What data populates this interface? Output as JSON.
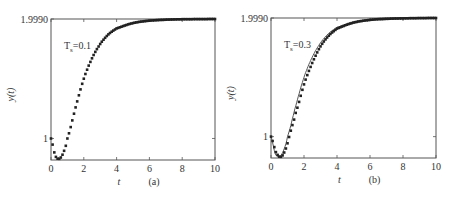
{
  "chart_data": [
    {
      "type": "line",
      "panel_label": "(a)",
      "annotation": {
        "text": "T",
        "subscript": "s",
        "value": "=0.1"
      },
      "xlabel": "t",
      "ylabel": "y(t)",
      "xlim": [
        0,
        10
      ],
      "ylim": [
        0.82,
        1.999
      ],
      "xticks": [
        "0",
        "2",
        "4",
        "6",
        "8",
        "10"
      ],
      "yticks": [
        "1",
        "1.9990"
      ],
      "series": [
        {
          "name": "response",
          "style": "dotted-markers",
          "x": [
            0,
            0.25,
            0.5,
            0.75,
            1,
            1.5,
            2,
            2.5,
            3,
            3.5,
            4,
            5,
            6,
            7,
            8,
            9,
            10
          ],
          "y": [
            1.0,
            0.86,
            0.83,
            0.88,
            1.0,
            1.26,
            1.5,
            1.67,
            1.79,
            1.87,
            1.92,
            1.965,
            1.985,
            1.993,
            1.997,
            1.998,
            1.999
          ]
        }
      ]
    },
    {
      "type": "line",
      "panel_label": "(b)",
      "annotation": {
        "text": "T",
        "subscript": "s",
        "value": "=0.3"
      },
      "xlabel": "t",
      "ylabel": "y(t)",
      "xlim": [
        0,
        10
      ],
      "ylim": [
        0.82,
        1.999
      ],
      "xticks": [
        "0",
        "2",
        "4",
        "6",
        "8",
        "10"
      ],
      "yticks": [
        "1",
        "1.9990"
      ],
      "series": [
        {
          "name": "continuous",
          "style": "solid",
          "x": [
            0,
            0.25,
            0.5,
            0.75,
            1,
            1.5,
            2,
            2.5,
            3,
            3.5,
            4,
            5,
            6,
            7,
            8,
            9,
            10
          ],
          "y": [
            1.0,
            0.86,
            0.83,
            0.88,
            1.0,
            1.26,
            1.5,
            1.67,
            1.79,
            1.87,
            1.92,
            1.965,
            1.985,
            1.993,
            1.997,
            1.998,
            1.999
          ]
        },
        {
          "name": "sampled",
          "style": "dotted-markers",
          "x": [
            0,
            0.3,
            0.6,
            0.9,
            1.2,
            1.5,
            2,
            2.5,
            3,
            3.5,
            4,
            5,
            6,
            7,
            8,
            9,
            10
          ],
          "y": [
            1.0,
            0.87,
            0.83,
            0.9,
            1.05,
            1.2,
            1.44,
            1.62,
            1.76,
            1.85,
            1.91,
            1.96,
            1.983,
            1.992,
            1.996,
            1.998,
            1.999
          ]
        }
      ]
    }
  ]
}
